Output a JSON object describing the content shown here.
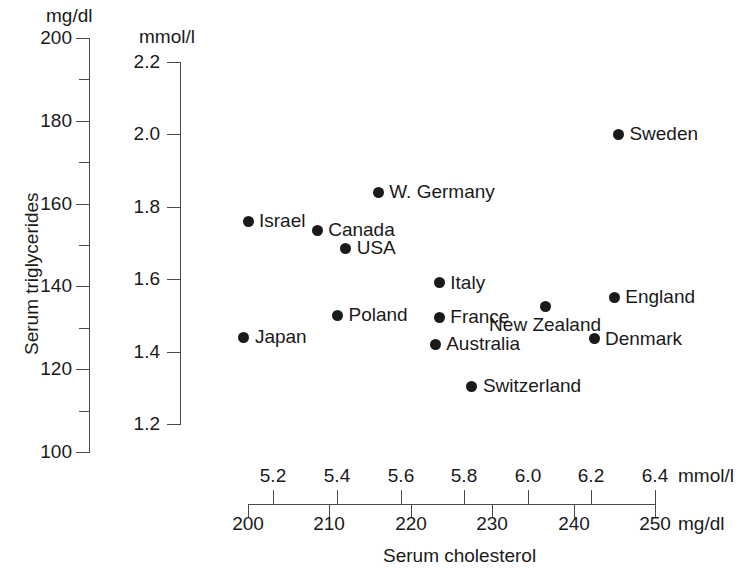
{
  "chart_data": {
    "type": "scatter",
    "title": "",
    "xlabel": "Serum cholesterol",
    "ylabel": "Serum triglycerides",
    "x_units_primary": "mg/dl",
    "x_units_secondary": "mmol/l",
    "y_units_primary": "mg/dl",
    "y_units_secondary": "mmol/l",
    "xlim_mgdl": [
      200,
      250
    ],
    "ylim_mgdl": [
      100,
      200
    ],
    "xlim_mmol": [
      5.08,
      6.43
    ],
    "ylim_mmol": [
      1.13,
      2.26
    ],
    "grid": false,
    "legend": false,
    "x_ticks_mgdl": [
      "200",
      "210",
      "220",
      "230",
      "240",
      "250"
    ],
    "x_ticks_mmol": [
      "5.2",
      "5.4",
      "5.6",
      "5.8",
      "6.0",
      "6.2",
      "6.4"
    ],
    "y_ticks_mgdl": [
      "200",
      "",
      "180",
      "",
      "160",
      "",
      "140",
      "",
      "120",
      "",
      "100"
    ],
    "y_ticks_mgdl_major": [
      "200",
      "180",
      "160",
      "140",
      "120",
      "100"
    ],
    "y_ticks_mmol": [
      "2.2",
      "2.0",
      "1.8",
      "1.6",
      "1.4",
      "1.2"
    ],
    "points": [
      {
        "label": "Sweden",
        "cholesterol_mgdl": 245.5,
        "triglycerides_mmol": 2.0,
        "triglycerides_mgdl": 177,
        "label_pos": "right"
      },
      {
        "label": "W. Germany",
        "cholesterol_mgdl": 216.0,
        "triglycerides_mmol": 1.84,
        "triglycerides_mgdl": 163,
        "label_pos": "right"
      },
      {
        "label": "Israel",
        "cholesterol_mgdl": 200.0,
        "triglycerides_mmol": 1.76,
        "triglycerides_mgdl": 156,
        "label_pos": "right"
      },
      {
        "label": "Canada",
        "cholesterol_mgdl": 208.5,
        "triglycerides_mmol": 1.735,
        "triglycerides_mgdl": 154,
        "label_pos": "right"
      },
      {
        "label": "USA",
        "cholesterol_mgdl": 212.0,
        "triglycerides_mmol": 1.685,
        "triglycerides_mgdl": 149,
        "label_pos": "right"
      },
      {
        "label": "Italy",
        "cholesterol_mgdl": 223.5,
        "triglycerides_mmol": 1.59,
        "triglycerides_mgdl": 141,
        "label_pos": "right"
      },
      {
        "label": "England",
        "cholesterol_mgdl": 245.0,
        "triglycerides_mmol": 1.55,
        "triglycerides_mgdl": 137,
        "label_pos": "right"
      },
      {
        "label": "New Zealand",
        "cholesterol_mgdl": 236.5,
        "triglycerides_mmol": 1.525,
        "triglycerides_mgdl": 135,
        "label_pos": "below"
      },
      {
        "label": "Poland",
        "cholesterol_mgdl": 211.0,
        "triglycerides_mmol": 1.5,
        "triglycerides_mgdl": 133,
        "label_pos": "right"
      },
      {
        "label": "France",
        "cholesterol_mgdl": 223.5,
        "triglycerides_mmol": 1.495,
        "triglycerides_mgdl": 132,
        "label_pos": "right"
      },
      {
        "label": "Japan",
        "cholesterol_mgdl": 199.5,
        "triglycerides_mmol": 1.44,
        "triglycerides_mgdl": 128,
        "label_pos": "right"
      },
      {
        "label": "Denmark",
        "cholesterol_mgdl": 242.5,
        "triglycerides_mmol": 1.435,
        "triglycerides_mgdl": 127,
        "label_pos": "right"
      },
      {
        "label": "Australia",
        "cholesterol_mgdl": 223.0,
        "triglycerides_mmol": 1.42,
        "triglycerides_mgdl": 126,
        "label_pos": "right"
      },
      {
        "label": "Switzerland",
        "cholesterol_mgdl": 227.5,
        "triglycerides_mmol": 1.305,
        "triglycerides_mgdl": 116,
        "label_pos": "right"
      }
    ]
  },
  "axes": {
    "y_primary_unit": "mg/dl",
    "y_secondary_unit": "mmol/l",
    "x_secondary_unit": "mmol/l",
    "x_primary_unit": "mg/dl",
    "y_title": "Serum triglycerides",
    "x_title": "Serum cholesterol"
  }
}
